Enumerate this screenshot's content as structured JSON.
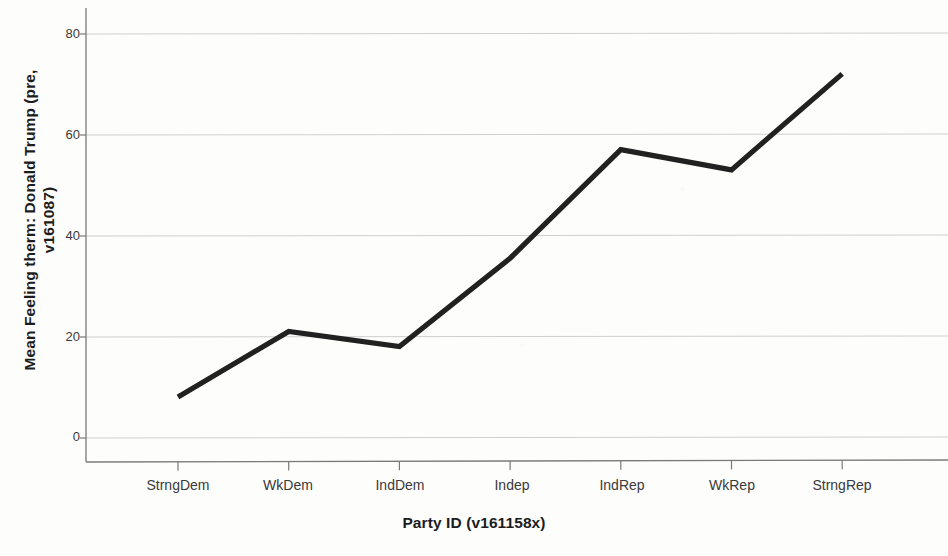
{
  "chart_data": {
    "type": "line",
    "title": "",
    "subtitle": "",
    "xlabel": "Party ID (v161158x)",
    "ylabel": "Mean Feeling therm: Donald Trump (pre, v161087)",
    "ylabel_lines": [
      "Mean Feeling therm: Donald Trump (pre,",
      "v161087)"
    ],
    "categories": [
      "StrngDem",
      "WkDem",
      "IndDem",
      "Indep",
      "IndRep",
      "WkRep",
      "StrngRep"
    ],
    "values": [
      8,
      21,
      18,
      35.5,
      57,
      53,
      72
    ],
    "series": [
      {
        "name": "Mean Feeling therm: Donald Trump (pre, v161087)",
        "values": [
          8,
          21,
          18,
          35.5,
          57,
          53,
          72
        ]
      }
    ],
    "ylim": [
      0,
      84
    ],
    "yticks": [
      0,
      20,
      40,
      60,
      80
    ],
    "ytick_labels": [
      "0",
      "20",
      "40",
      "60",
      "80"
    ],
    "xtick_labels": [
      "StrngDem",
      "WkDem",
      "IndDem",
      "Indep",
      "IndRep",
      "WkRep",
      "StrngRep"
    ],
    "grid": "horizontal",
    "legend": "none",
    "line_color": "#212121",
    "grid_color": "#cfcfcf",
    "axis_color": "#6b6b6b",
    "background_color": "#fdfdfc"
  },
  "axis": {
    "y_tick_0": "0",
    "y_tick_1": "20",
    "y_tick_2": "40",
    "y_tick_3": "60",
    "y_tick_4": "80"
  }
}
